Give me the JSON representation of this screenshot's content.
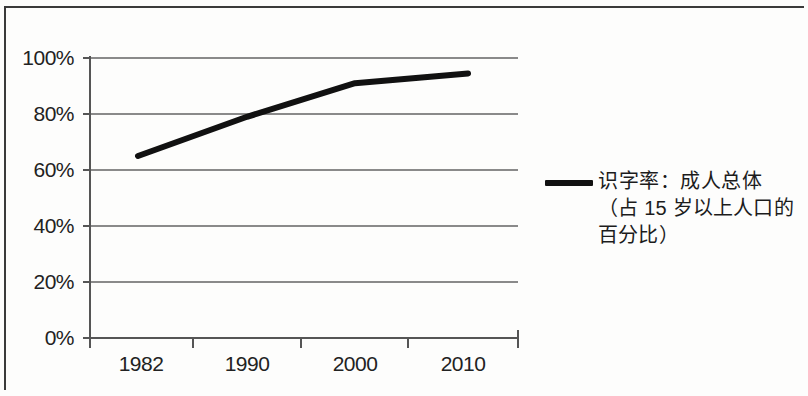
{
  "chart_data": {
    "type": "line",
    "title": "",
    "subtitle": "",
    "xlabel": "",
    "ylabel": "",
    "categories": [
      "1982",
      "1990",
      "2000",
      "2010"
    ],
    "x": [
      "1982",
      "1990",
      "2000",
      "2010"
    ],
    "series": [
      {
        "name": "识字率：成人总体（占 15 岁以上人口的百分比）",
        "values": [
          65,
          79,
          91,
          94.5
        ],
        "color": "#111111",
        "line_width": 6
      }
    ],
    "values": [
      65,
      79,
      91,
      94.5
    ],
    "ylim": [
      0,
      100
    ],
    "y_ticks": [
      0,
      20,
      40,
      60,
      80,
      100
    ],
    "y_tick_labels": [
      "0%",
      "20%",
      "40%",
      "60%",
      "80%",
      "100%"
    ],
    "x_tick_labels": [
      "1982",
      "1990",
      "2000",
      "2010"
    ],
    "grid": "horizontal",
    "legend_position": "right",
    "legend_entries": [
      {
        "label_line_1": "识字率：成人总体",
        "label_line_2": "（占 15 岁以上人口的",
        "label_line_3": "百分比）",
        "marker": "line-swatch",
        "color": "#111111"
      }
    ]
  },
  "axes": {
    "y_labels": [
      "100%",
      "80%",
      "60%",
      "40%",
      "20%",
      "0%"
    ],
    "x_labels": [
      "1982",
      "1990",
      "2000",
      "2010"
    ]
  },
  "legend": {
    "line_1": "识字率：成人总体",
    "line_2": "（占 15 岁以上人口的",
    "line_3": "百分比）"
  },
  "colors": {
    "series": "#111111",
    "grid": "#8a8a8a",
    "axis": "#555555",
    "frame": "#3a3a3a",
    "text": "#1c1c1c",
    "background": "#fdfdfc"
  }
}
